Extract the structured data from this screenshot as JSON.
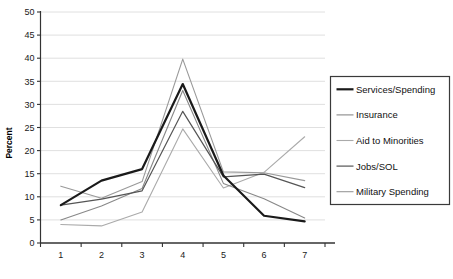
{
  "chart_data": {
    "type": "line",
    "title": "",
    "xlabel": "",
    "ylabel": "Percent",
    "xlim": [
      0.5,
      7.5
    ],
    "ylim": [
      0,
      50
    ],
    "ytick_step": 5,
    "grid": true,
    "grid_axis": "y",
    "legend_position": "right",
    "categories": [
      "1",
      "2",
      "3",
      "4",
      "5",
      "6",
      "7"
    ],
    "x": [
      1,
      2,
      3,
      4,
      5,
      6,
      7
    ],
    "series": [
      {
        "name": "Services/Spending",
        "color": "#1a1a1a",
        "width": 2.2,
        "values": [
          8.2,
          13.5,
          16.0,
          34.4,
          14.6,
          5.9,
          4.7
        ]
      },
      {
        "name": "Insurance",
        "color": "#888888",
        "width": 1.1,
        "values": [
          5.0,
          8.0,
          11.8,
          33.0,
          12.9,
          9.6,
          5.4
        ]
      },
      {
        "name": "Aid to Minorities",
        "color": "#aaaaaa",
        "width": 1.1,
        "values": [
          4.0,
          3.7,
          6.7,
          24.7,
          11.9,
          15.3,
          23.0
        ]
      },
      {
        "name": "Jobs/SOL",
        "color": "#555555",
        "width": 1.2,
        "values": [
          8.2,
          9.5,
          11.3,
          28.5,
          14.3,
          14.9,
          12.0
        ]
      },
      {
        "name": "Military Spending",
        "color": "#999999",
        "width": 1.1,
        "values": [
          12.3,
          9.7,
          13.3,
          39.8,
          15.4,
          15.2,
          13.5
        ]
      }
    ],
    "yticks": [
      {
        "value": 0,
        "label": "0"
      },
      {
        "value": 5,
        "label": "5"
      },
      {
        "value": 10,
        "label": "10"
      },
      {
        "value": 15,
        "label": "15"
      },
      {
        "value": 20,
        "label": "20"
      },
      {
        "value": 25,
        "label": "25"
      },
      {
        "value": 30,
        "label": "30"
      },
      {
        "value": 35,
        "label": "35"
      },
      {
        "value": 40,
        "label": "40"
      },
      {
        "value": 45,
        "label": "45"
      },
      {
        "value": 50,
        "label": "50"
      }
    ],
    "xticks": [
      {
        "value": 1,
        "label": "1"
      },
      {
        "value": 2,
        "label": "2"
      },
      {
        "value": 3,
        "label": "3"
      },
      {
        "value": 4,
        "label": "4"
      },
      {
        "value": 5,
        "label": "5"
      },
      {
        "value": 6,
        "label": "6"
      },
      {
        "value": 7,
        "label": "7"
      }
    ]
  },
  "legend": {
    "items": [
      {
        "label": "Services/Spending",
        "color": "#1a1a1a",
        "width": 2.2
      },
      {
        "label": "Insurance",
        "color": "#888888",
        "width": 1.1
      },
      {
        "label": "Aid to Minorities",
        "color": "#aaaaaa",
        "width": 1.1
      },
      {
        "label": "Jobs/SOL",
        "color": "#555555",
        "width": 1.2
      },
      {
        "label": "Military Spending",
        "color": "#999999",
        "width": 1.1
      }
    ]
  },
  "colors": {
    "axis": "#333333",
    "grid": "#d8d8d8",
    "legend_border": "#3a3a3a",
    "background": "#ffffff"
  }
}
